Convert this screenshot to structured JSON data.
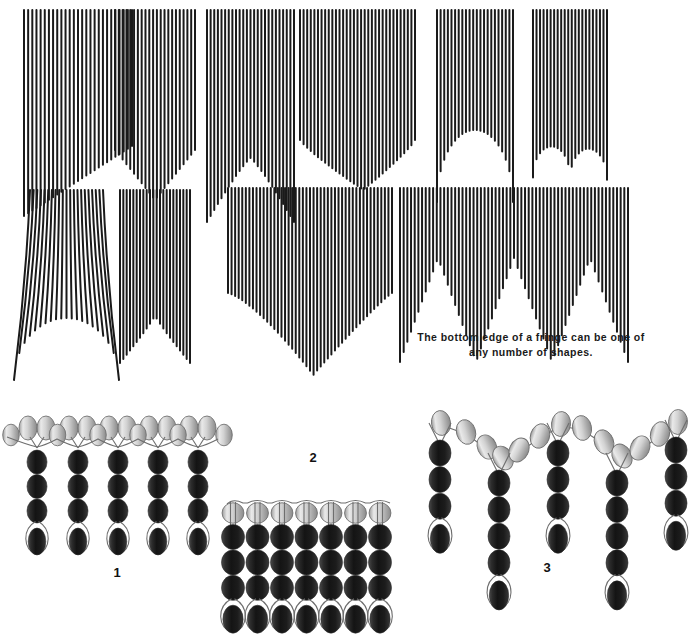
{
  "page": {
    "background_color": "#ffffff",
    "width": 697,
    "height": 641
  },
  "fringe_caption": {
    "text": "The bottom edge of a fringe can be one of\nany number of shapes."
  },
  "figure_labels": [
    {
      "id": "1",
      "label": "1"
    },
    {
      "id": "2",
      "label": "2"
    },
    {
      "id": "3",
      "label": "3"
    }
  ],
  "colors": {
    "strand": "#1a1a1a",
    "background": "#ffffff",
    "bead_dark_light": "#5b5b5b",
    "bead_dark_mid": "#2a2a2a",
    "bead_dark_deep": "#121212",
    "bead_light_hi": "#f2f2f2",
    "bead_light_mid": "#c9c9c9",
    "bead_light_low": "#8f8f8f",
    "bead_outline": "#5a5a5a",
    "thread": "#6e6e6e",
    "text": "#111111"
  },
  "fringe_samples": [
    {
      "name": "diagonal-right-down",
      "shape": "diagonal",
      "x": 24,
      "y": 10,
      "width": 108,
      "top_length": 136,
      "strand_count": 27,
      "description": "Straight diagonal bottom edge sloping down to the left"
    },
    {
      "name": "angled-point-center",
      "shape": "point-down",
      "x": 115,
      "y": 10,
      "width": 80,
      "top_length": 140,
      "strand_count": 22,
      "description": "Bottom edge dips to a low point then rises"
    },
    {
      "name": "inverted-v-peak",
      "shape": "inverted-v",
      "x": 207,
      "y": 10,
      "width": 87,
      "top_length": 148,
      "strand_count": 25,
      "description": "Bottom edge rises to a central peak"
    },
    {
      "name": "wide-point",
      "shape": "wide-point",
      "x": 300,
      "y": 10,
      "width": 115,
      "top_length": 130,
      "strand_count": 33,
      "description": "Broad shallow point near the centre"
    },
    {
      "name": "arch-cutout",
      "shape": "arch",
      "x": 437,
      "y": 10,
      "width": 76,
      "top_length": 120,
      "strand_count": 22,
      "description": "Semicircular arch cut out of the bottom edge"
    },
    {
      "name": "double-scallop",
      "shape": "double-scallop",
      "x": 533,
      "y": 10,
      "width": 74,
      "top_length": 125,
      "strand_count": 22,
      "description": "Two shallow scallops forming a rounded W"
    },
    {
      "name": "flared-curve",
      "shape": "flared-u",
      "x": 30,
      "y": 190,
      "width": 73,
      "top_length": 118,
      "strand_count": 21,
      "description": "Strands flare outward with a U shaped bottom edge"
    },
    {
      "name": "v-notch",
      "shape": "v-notch",
      "x": 120,
      "y": 190,
      "width": 70,
      "top_length": 115,
      "strand_count": 22,
      "description": "Sharp V notch in the centre of the bottom edge"
    },
    {
      "name": "deep-point",
      "shape": "deep-point",
      "x": 228,
      "y": 188,
      "width": 164,
      "top_length": 105,
      "strand_count": 47,
      "description": "Wide fringe with one deep central point"
    },
    {
      "name": "triple-zigzag",
      "shape": "triple-zigzag",
      "x": 400,
      "y": 188,
      "width": 228,
      "top_length": 70,
      "strand_count": 63,
      "description": "Three repeating zigzag points across the width"
    }
  ],
  "bead_figures": [
    {
      "id": "1",
      "name": "straight-edge-beaded-fringe",
      "label": "1",
      "columns": 5,
      "top_beads_per_column": 2,
      "dark_beads_per_column": 3,
      "has_loop_bead": true,
      "loop_bead_color": "dark",
      "top_bead_color": "light",
      "body_bead_color": "dark",
      "description": "Five equal length dangles hanging from a row of light beads, each ending in a looped dark bead"
    },
    {
      "id": "2",
      "name": "dense-beaded-fringe",
      "label": "2",
      "columns": 7,
      "top_beads_per_column": 1,
      "dark_beads_per_column": 3,
      "has_loop_bead": true,
      "loop_bead_color": "dark",
      "top_bead_color": "light",
      "body_bead_color": "dark",
      "description": "Seven tightly packed dangles of equal length forming a solid block"
    },
    {
      "id": "3",
      "name": "scalloped-beaded-fringe",
      "label": "3",
      "columns": 5,
      "dangle_lengths": [
        3,
        4,
        3,
        4,
        3
      ],
      "top_bead_color": "light",
      "body_bead_color": "dark",
      "has_loop_bead": true,
      "loop_bead_color": "dark",
      "description": "Dangles of alternating lengths hung from a scalloped V shaped top row of light beads"
    }
  ]
}
